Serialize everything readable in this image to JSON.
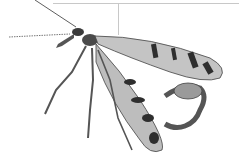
{
  "image": {
    "subject": "scorpionfly illustration",
    "description": "Grayscale scientific illustration of a scorpionfly with patterned wings and curled tail, with a leader line pointing to the wing",
    "colors": {
      "background": "#ffffff",
      "ink": "#2a2a2a",
      "wing": "#bdbdbd",
      "leader": "#c8c8c8"
    }
  }
}
